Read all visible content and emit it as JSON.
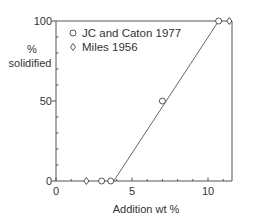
{
  "chart_data": {
    "type": "scatter",
    "title": "",
    "xlabel": "Addition wt %",
    "ylabel": "% solidified",
    "ylabel_lines": [
      "%",
      "solidified"
    ],
    "xlim": [
      0,
      11.6
    ],
    "ylim": [
      0,
      100
    ],
    "x_ticks": [
      0,
      5,
      10
    ],
    "x_minor_ticks": [
      1,
      2,
      3,
      4,
      6,
      7,
      8,
      9,
      11
    ],
    "y_ticks": [
      0,
      50,
      100
    ],
    "y_minor_ticks": [
      10,
      20,
      30,
      40,
      60,
      70,
      80,
      90
    ],
    "grid": false,
    "legend_position": "upper left",
    "series": [
      {
        "name": "JC and Caton 1977",
        "marker": "circle",
        "x": [
          3.0,
          3.6,
          7.0,
          10.7
        ],
        "y": [
          0,
          0,
          50,
          100
        ]
      },
      {
        "name": "Miles 1956",
        "marker": "diamond",
        "x": [
          2.0,
          11.4
        ],
        "y": [
          0,
          100
        ]
      }
    ],
    "trend_line": {
      "x": [
        3.8,
        10.7
      ],
      "y": [
        0,
        100
      ]
    }
  },
  "labels": {
    "x_axis": "Addition wt %",
    "y_axis_line1": "%",
    "y_axis_line2": "solidified",
    "legend": [
      "JC and Caton 1977",
      "Miles 1956"
    ],
    "legend_symbols": [
      "○",
      "◊"
    ],
    "x_tick_labels": [
      "0",
      "5",
      "10"
    ],
    "y_tick_labels": [
      "0",
      "50",
      "100"
    ]
  }
}
